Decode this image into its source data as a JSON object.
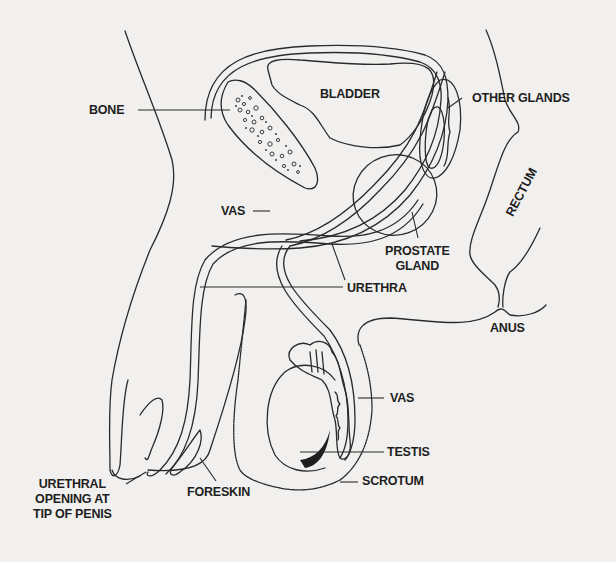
{
  "labels": {
    "bone": "BONE",
    "bladder": "BLADDER",
    "other_glands": "OTHER GLANDS",
    "rectum": "RECTUM",
    "vas_upper": "VAS",
    "prostate_line1": "PROSTATE",
    "prostate_line2": "GLAND",
    "urethra": "URETHRA",
    "anus": "ANUS",
    "vas_lower": "VAS",
    "testis": "TESTIS",
    "scrotum": "SCROTUM",
    "foreskin": "FORESKIN",
    "urethral_opening_line1": "URETHRAL",
    "urethral_opening_line2": "OPENING AT",
    "urethral_opening_line3": "TIP OF PENIS"
  },
  "colors": {
    "background": "#f1f0ee",
    "ink": "#2a2a2a"
  }
}
